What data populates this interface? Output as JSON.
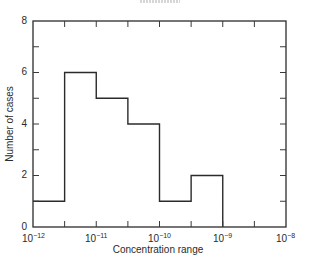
{
  "chart_data": {
    "type": "bar",
    "subtype": "histogram",
    "title": "",
    "xlabel": "Concentration range",
    "ylabel": "Number of cases",
    "xscale": "log",
    "x_tick_labels": [
      "10^-12",
      "10^-11",
      "10^-10",
      "10^-9",
      "10^-8"
    ],
    "x_tick_exponents": [
      -12,
      -11,
      -10,
      -9,
      -8
    ],
    "y_tick_labels": [
      "0",
      "2",
      "4",
      "6",
      "8"
    ],
    "ylim": [
      0,
      8
    ],
    "xlim_exponent": [
      -12,
      -8
    ],
    "bin_edges_exponent": [
      -12,
      -11.5,
      -11,
      -10.5,
      -10,
      -9.5,
      -9
    ],
    "categories": [
      "10^-12–10^-11.5",
      "10^-11.5–10^-11",
      "10^-11–10^-10.5",
      "10^-10.5–10^-10",
      "10^-10–10^-9.5",
      "10^-9.5–10^-9"
    ],
    "values": [
      1,
      6,
      5,
      4,
      1,
      2
    ],
    "grid": false,
    "legend": null
  },
  "labels": {
    "ylabel": "Number of cases",
    "xlabel": "Concentration range",
    "y0": "0",
    "y2": "2",
    "y4": "4",
    "y6": "6",
    "y8": "8",
    "xbase": "10",
    "xexp0": "−12",
    "xexp1": "−11",
    "xexp2": "−10",
    "xexp3": "−9",
    "xexp4": "−8"
  }
}
